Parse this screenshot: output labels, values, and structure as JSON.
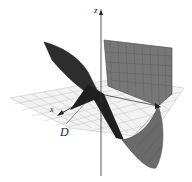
{
  "figure": {
    "axes": {
      "z_label": "z",
      "x_label": "x",
      "y_label": "y"
    },
    "region_label": "D",
    "colors": {
      "surface_dark": "#2a2a2a",
      "surface_mid": "#6a6a6a",
      "grid": "#bdbdbd",
      "plane": "#f2f2f2"
    }
  }
}
